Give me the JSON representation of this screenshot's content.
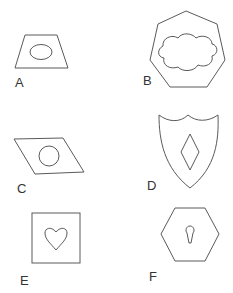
{
  "figure": {
    "panels": [
      {
        "id": "A",
        "label": "A",
        "outer": "trapezoid",
        "inner": "ellipse"
      },
      {
        "id": "B",
        "label": "B",
        "outer": "heptagon",
        "inner": "cloud"
      },
      {
        "id": "C",
        "label": "C",
        "outer": "parallelogram",
        "inner": "circle"
      },
      {
        "id": "D",
        "label": "D",
        "outer": "shield",
        "inner": "diamond"
      },
      {
        "id": "E",
        "label": "E",
        "outer": "square",
        "inner": "heart"
      },
      {
        "id": "F",
        "label": "F",
        "outer": "hexagon",
        "inner": "keyhole"
      }
    ],
    "stroke_color": "#5a5a5a",
    "text_color": "#333333",
    "background": "#ffffff"
  }
}
